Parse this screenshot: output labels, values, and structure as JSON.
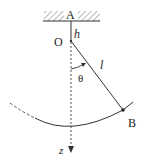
{
  "diagram": {
    "labels": {
      "A": "A",
      "O": "O",
      "h": "h",
      "l": "l",
      "theta": "θ",
      "B": "B",
      "z": "z"
    },
    "colors": {
      "stroke": "#333333",
      "hatch": "#777777",
      "background": "#ffffff"
    }
  }
}
